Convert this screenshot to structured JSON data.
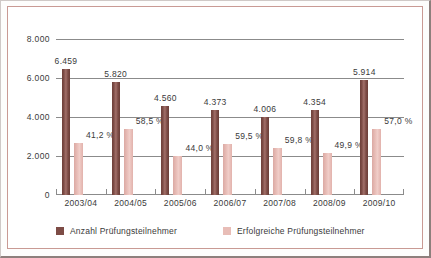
{
  "chart_data": {
    "type": "bar",
    "title": "",
    "subtitle": "",
    "xlabel": "",
    "ylabel": "",
    "ylim": [
      0,
      8000
    ],
    "yticks": [
      "0",
      "2.000",
      "4.000",
      "6.000",
      "8.000"
    ],
    "ytick_values": [
      0,
      2000,
      4000,
      6000,
      8000
    ],
    "grid": true,
    "legend_position": "bottom-left",
    "categories": [
      "2003/04",
      "2004/05",
      "2005/06",
      "2006/07",
      "2007/08",
      "2008/09",
      "2009/10"
    ],
    "series": [
      {
        "name": "Anzahl Prüfungsteilnehmer",
        "color": "#7d4c46",
        "values": [
          6459,
          5820,
          4560,
          4373,
          4006,
          4354,
          5914
        ],
        "labels": [
          "6.459",
          "5.820",
          "4.560",
          "4.373",
          "4.006",
          "4.354",
          "5.914"
        ]
      },
      {
        "name": "Erfolgreiche Prüfungsteilnehmer",
        "color": "#e8bdb7",
        "values": [
          2661,
          3405,
          2006,
          2602,
          2396,
          2173,
          3371
        ],
        "labels": [
          "41,2 %",
          "58,5 %",
          "44,0 %",
          "59,5 %",
          "59,8 %",
          "49,9 %",
          "57,0 %"
        ],
        "percent_values": [
          41.2,
          58.5,
          44.0,
          59.5,
          59.8,
          49.9,
          57.0
        ]
      }
    ]
  },
  "legend": {
    "items": [
      {
        "label": "Anzahl Prüfungsteilnehmer",
        "color": "#7d4c46"
      },
      {
        "label": "Erfolgreiche Prüfungsteilnehmer",
        "color": "#e8bdb7"
      }
    ]
  }
}
